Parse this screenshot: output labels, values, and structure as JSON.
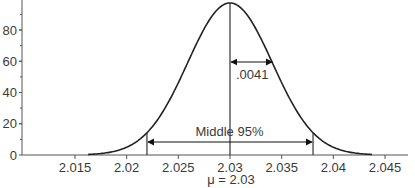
{
  "chart_data": {
    "type": "line",
    "title": "",
    "xlabel": "μ = 2.03",
    "ylabel": "",
    "distribution": {
      "kind": "normal",
      "mean": 2.03,
      "sd": 0.0041
    },
    "x_ticks": [
      2.015,
      2.02,
      2.025,
      2.03,
      2.035,
      2.04,
      2.045
    ],
    "x_tick_labels": [
      "2.015",
      "2.02",
      "2.025",
      "2.03",
      "2.035",
      "2.04",
      "2.045"
    ],
    "y_ticks": [
      0,
      20,
      40,
      60,
      80
    ],
    "y_tick_labels": [
      "0",
      "20",
      "40",
      "60",
      "80"
    ],
    "xlim": [
      2.0105,
      2.0485
    ],
    "ylim": [
      0,
      100
    ],
    "grid": false,
    "series": [
      {
        "name": "Normal density",
        "x": [
          2.0177,
          2.0198,
          2.0218,
          2.0239,
          2.0259,
          2.028,
          2.03,
          2.032,
          2.0341,
          2.0361,
          2.0382,
          2.0402,
          2.0423
        ],
        "y": [
          1.1,
          3.7,
          10.6,
          23.6,
          43.0,
          72.2,
          97.3,
          72.2,
          43.0,
          23.6,
          10.6,
          3.7,
          1.1
        ]
      }
    ],
    "annotations": [
      {
        "type": "vline",
        "x": 2.03,
        "label": "mean"
      },
      {
        "type": "arrow",
        "from": 2.03,
        "to": 2.0341,
        "label": ".0041"
      },
      {
        "type": "vline",
        "x": 2.022,
        "label": "lower 2.5%"
      },
      {
        "type": "vline",
        "x": 2.038,
        "label": "upper 97.5%"
      },
      {
        "type": "double-arrow",
        "from": 2.022,
        "to": 2.038,
        "label": "Middle 95%"
      }
    ],
    "legend": null
  },
  "labels": {
    "sd_label": ".0041",
    "middle_label": "Middle 95%",
    "mu_label": "μ = 2.03"
  },
  "colors": {
    "line": "#222222",
    "text": "#3a3a3a",
    "axis": "#555555"
  }
}
